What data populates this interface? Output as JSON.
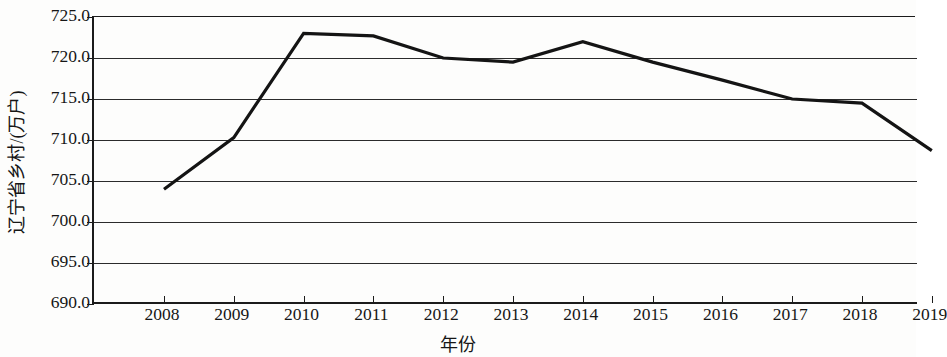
{
  "chart_data": {
    "type": "line",
    "title": "",
    "xlabel": "年份",
    "ylabel": "辽宁省乡村/(万户)",
    "x": [
      2008,
      2009,
      2010,
      2011,
      2012,
      2013,
      2014,
      2015,
      2016,
      2017,
      2018,
      2019
    ],
    "categories": [
      "2008",
      "2009",
      "2010",
      "2011",
      "2012",
      "2013",
      "2014",
      "2015",
      "2016",
      "2017",
      "2018",
      "2019"
    ],
    "values": [
      704.0,
      710.3,
      723.0,
      722.7,
      720.0,
      719.5,
      722.0,
      719.5,
      717.3,
      715.0,
      714.5,
      708.7
    ],
    "series": [
      {
        "name": "辽宁省乡村户数",
        "values": [
          704.0,
          710.3,
          723.0,
          722.7,
          720.0,
          719.5,
          722.0,
          719.5,
          717.3,
          715.0,
          714.5,
          708.7
        ]
      }
    ],
    "ylim": [
      690.0,
      725.0
    ],
    "ytick_labels": [
      "690.0",
      "695.0",
      "700.0",
      "705.0",
      "710.0",
      "715.0",
      "720.0",
      "725.0"
    ],
    "ytick_values": [
      690.0,
      695.0,
      700.0,
      705.0,
      710.0,
      715.0,
      720.0,
      725.0
    ],
    "xtick_labels": [
      "2008",
      "2009",
      "2010",
      "2011",
      "2012",
      "2013",
      "2014",
      "2015",
      "2016",
      "2017",
      "2018",
      "2019"
    ],
    "grid": true,
    "grid_axis": "y",
    "legend": false,
    "legend_position": "none",
    "line_color": "#141414",
    "grid_color": "#2b2b2b",
    "background_color": "#fdfdfc",
    "markers": false
  }
}
